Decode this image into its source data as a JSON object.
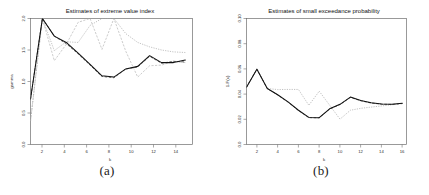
{
  "figure": {
    "panels": [
      {
        "caption": "(a)",
        "title": "Estimates of extreme value index",
        "xlabel": "k",
        "ylabel": "gamma",
        "xticks": [
          "2",
          "4",
          "6",
          "8",
          "10",
          "12",
          "14"
        ],
        "yticks": [
          "0.0",
          "0.5",
          "1.0",
          "1.5",
          "2.0"
        ]
      },
      {
        "caption": "(b)",
        "title": "Estimates of small exceedance probability",
        "xlabel": "k",
        "ylabel": "1-F(x)",
        "xticks": [
          "2",
          "4",
          "6",
          "8",
          "10",
          "12",
          "14",
          "16"
        ],
        "yticks": [
          "0.0",
          "0.02",
          "0.04",
          "0.06",
          "0.08",
          "0.10"
        ]
      }
    ]
  },
  "chart_data": [
    {
      "type": "line",
      "title": "Estimates of extreme value index",
      "xlabel": "k",
      "ylabel": "gamma",
      "xlim": [
        1,
        14.6
      ],
      "ylim": [
        0.0,
        2.0
      ],
      "xticks": [
        2,
        4,
        6,
        8,
        10,
        12,
        14
      ],
      "yticks": [
        0.0,
        0.5,
        1.0,
        1.5,
        2.0
      ],
      "grid": false,
      "legend": "none",
      "x": [
        1,
        2,
        3,
        4,
        5,
        6,
        7,
        8,
        9,
        10,
        11,
        12,
        13,
        14
      ],
      "series": [
        {
          "name": "estimator-solid",
          "style": "solid",
          "color": "#111111",
          "values": [
            0.72,
            2.0,
            1.72,
            1.62,
            1.45,
            1.27,
            1.09,
            1.07,
            1.2,
            1.24,
            1.41,
            1.3,
            1.3,
            1.34
          ]
        },
        {
          "name": "estimator-dashed",
          "style": "dashed",
          "color": "#3a3a3a",
          "values": [
            0.72,
            2.0,
            1.72,
            1.6,
            1.44,
            1.26,
            1.08,
            1.06,
            1.2,
            1.23,
            1.4,
            1.29,
            1.32,
            1.31
          ]
        },
        {
          "name": "estimator-dotted-a",
          "style": "dotted",
          "color": "#a8a8a8",
          "values": [
            0.37,
            2.0,
            1.49,
            1.63,
            1.62,
            1.89,
            2.0,
            2.0,
            1.76,
            1.62,
            1.55,
            1.5,
            1.47,
            1.46
          ]
        },
        {
          "name": "estimator-dotted-b",
          "style": "dotted",
          "color": "#b6b6b6",
          "values": [
            0.37,
            2.0,
            1.33,
            1.59,
            1.94,
            2.0,
            1.51,
            2.0,
            1.48,
            1.07,
            1.25,
            1.26,
            1.32,
            1.3
          ]
        }
      ]
    },
    {
      "type": "line",
      "title": "Estimates of small exceedance probability",
      "xlabel": "k",
      "ylabel": "1-F(x)",
      "xlim": [
        1,
        16.4
      ],
      "ylim": [
        0.0,
        0.1
      ],
      "xticks": [
        2,
        4,
        6,
        8,
        10,
        12,
        14,
        16
      ],
      "yticks": [
        0.0,
        0.02,
        0.04,
        0.06,
        0.08,
        0.1
      ],
      "grid": false,
      "legend": "none",
      "x": [
        1,
        2,
        3,
        4,
        5,
        6,
        7,
        8,
        9,
        10,
        11,
        12,
        13,
        14,
        15,
        16
      ],
      "series": [
        {
          "name": "probability-solid",
          "style": "solid",
          "color": "#111111",
          "values": [
            0.0455,
            0.0598,
            0.0444,
            0.0395,
            0.0338,
            0.0272,
            0.0215,
            0.0213,
            0.0283,
            0.0319,
            0.0376,
            0.0349,
            0.0331,
            0.0322,
            0.032,
            0.0327
          ]
        },
        {
          "name": "probability-dashed",
          "style": "dashed",
          "color": "#3a3a3a",
          "values": [
            0.0455,
            0.0598,
            0.0444,
            0.0394,
            0.0336,
            0.027,
            0.0213,
            0.0212,
            0.0281,
            0.0317,
            0.0374,
            0.0347,
            0.0329,
            0.032,
            0.0318,
            0.0325
          ]
        },
        {
          "name": "probability-dotted",
          "style": "dotted",
          "color": "#a8a8a8",
          "values": [
            0.0455,
            0.0598,
            0.0444,
            0.0436,
            0.0437,
            0.0437,
            0.0311,
            0.0423,
            0.0312,
            0.0201,
            0.0272,
            0.0287,
            0.0297,
            0.0306,
            0.0315,
            0.0327
          ]
        }
      ]
    }
  ]
}
